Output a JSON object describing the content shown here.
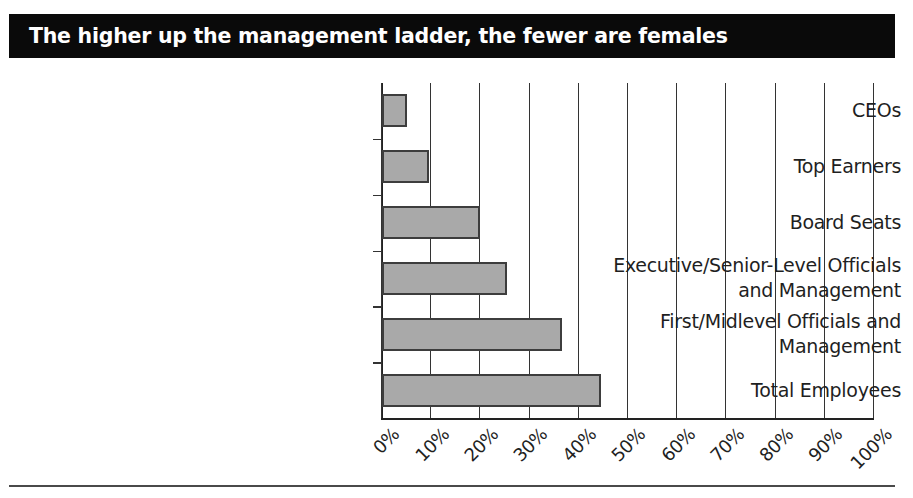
{
  "title": {
    "text": "The higher up the management ladder, the fewer are females",
    "background_color": "#0a0a0a",
    "text_color": "#ffffff"
  },
  "chart_data": {
    "type": "bar",
    "orientation": "horizontal",
    "title": "The higher up the management ladder, the fewer are females",
    "xlabel": "",
    "ylabel": "",
    "xlim": [
      0,
      100
    ],
    "grid": true,
    "legend": false,
    "bar_color": "#a9a9a9",
    "bar_border_color": "#3d3d3d",
    "categories": [
      "CEOs",
      "Top Earners",
      "Board Seats",
      "Executive/Senior-Level Officials and Management",
      "First/Midlevel Officials and Management",
      "Total Employees"
    ],
    "category_lines": [
      [
        "CEOs"
      ],
      [
        "Top Earners"
      ],
      [
        "Board Seats"
      ],
      [
        "Executive/Senior-Level Officials",
        "and Management"
      ],
      [
        "First/Midlevel Officials and",
        "Management"
      ],
      [
        "Total Employees"
      ]
    ],
    "values": [
      5,
      9.5,
      20,
      25.5,
      36.5,
      44.5
    ],
    "xticks": [
      0,
      10,
      20,
      30,
      40,
      50,
      60,
      70,
      80,
      90,
      100
    ],
    "xticklabels": [
      "0%",
      "10%",
      "20%",
      "30%",
      "40%",
      "50%",
      "60%",
      "70%",
      "80%",
      "90%",
      "100%"
    ]
  }
}
